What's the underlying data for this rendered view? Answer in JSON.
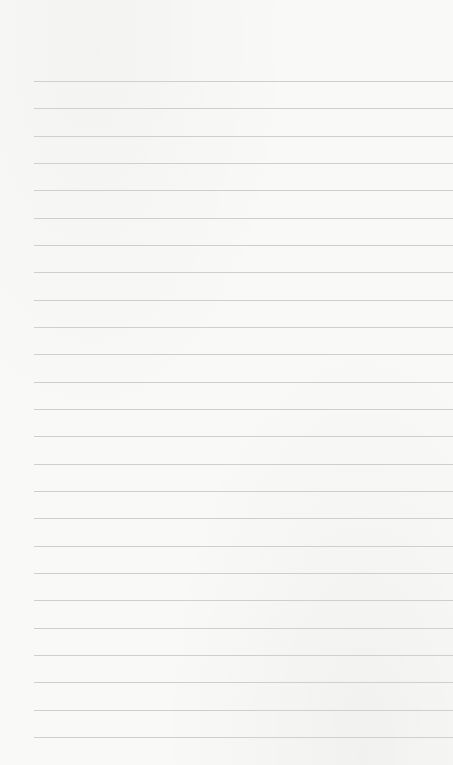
{
  "page": {
    "type": "lined-paper",
    "background_color": "#f9f9f7",
    "line_color": "#cfcfcc",
    "line_count": 25,
    "first_line_y": 81,
    "line_spacing": 27.33,
    "left_offset": 34
  }
}
